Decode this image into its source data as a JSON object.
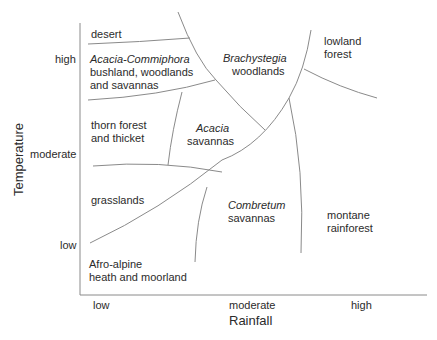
{
  "diagram": {
    "type": "biome-zone diagram",
    "x_axis": {
      "title": "Rainfall",
      "ticks": [
        "low",
        "moderate",
        "high"
      ]
    },
    "y_axis": {
      "title": "Temperature",
      "ticks": [
        "high",
        "moderate",
        "low"
      ]
    },
    "zones": [
      {
        "id": "desert",
        "lines": [
          "desert"
        ]
      },
      {
        "id": "acacia-commiphora",
        "italic": "Acacia-Commiphora",
        "lines": [
          "bushland, woodlands",
          "and savannas"
        ]
      },
      {
        "id": "brachystegia",
        "italic": "Brachystegia",
        "lines": [
          "woodlands"
        ]
      },
      {
        "id": "lowland-forest",
        "lines": [
          "lowland",
          "forest"
        ]
      },
      {
        "id": "thorn-forest",
        "lines": [
          "thorn forest",
          "and thicket"
        ]
      },
      {
        "id": "acacia-savannas",
        "italic": "Acacia",
        "lines": [
          "savannas"
        ]
      },
      {
        "id": "grasslands",
        "lines": [
          "grasslands"
        ]
      },
      {
        "id": "combretum",
        "italic": "Combretum",
        "lines": [
          "savannas"
        ]
      },
      {
        "id": "montane-rainforest",
        "lines": [
          "montane",
          "rainforest"
        ]
      },
      {
        "id": "afro-alpine",
        "lines": [
          "Afro-alpine",
          "heath and moorland"
        ]
      }
    ]
  }
}
